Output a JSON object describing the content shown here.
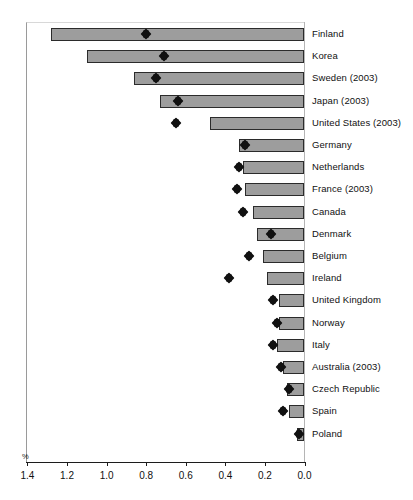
{
  "chart_data": {
    "type": "bar",
    "title": "",
    "subtitle": "",
    "xlabel": "%",
    "ylabel": "",
    "unit_label": "%",
    "orientation": "horizontal",
    "x_axis_reversed": true,
    "xlim": [
      1.4,
      0.0
    ],
    "xticks": [
      "1.4",
      "1.2",
      "1.0",
      "0.8",
      "0.6",
      "0.4",
      "0.2",
      "0.0"
    ],
    "xtick_values": [
      1.4,
      1.2,
      1.0,
      0.8,
      0.6,
      0.4,
      0.2,
      0.0
    ],
    "grid": false,
    "legend": "none",
    "bar_color": "#9d9d9d",
    "bar_edge_color": "#2b2b2b",
    "marker_color": "#111111",
    "marker_shape": "diamond",
    "categories": [
      "Finland",
      "Korea",
      "Sweden (2003)",
      "Japan (2003)",
      "United States (2003)",
      "Germany",
      "Netherlands",
      "France (2003)",
      "Canada",
      "Denmark",
      "Belgium",
      "Ireland",
      "United Kingdom",
      "Norway",
      "Italy",
      "Australia (2003)",
      "Czech Republic",
      "Spain",
      "Poland"
    ],
    "series": [
      {
        "name": "bar",
        "type": "bar",
        "values": [
          1.28,
          1.1,
          0.86,
          0.73,
          0.48,
          0.33,
          0.31,
          0.3,
          0.26,
          0.24,
          0.21,
          0.19,
          0.13,
          0.13,
          0.14,
          0.11,
          0.09,
          0.08,
          0.04
        ]
      },
      {
        "name": "marker",
        "type": "scatter",
        "values": [
          0.8,
          0.71,
          0.75,
          0.64,
          0.65,
          0.3,
          0.33,
          0.34,
          0.31,
          0.17,
          0.28,
          0.38,
          0.16,
          0.14,
          0.16,
          0.12,
          0.08,
          0.11,
          0.03
        ]
      }
    ]
  }
}
